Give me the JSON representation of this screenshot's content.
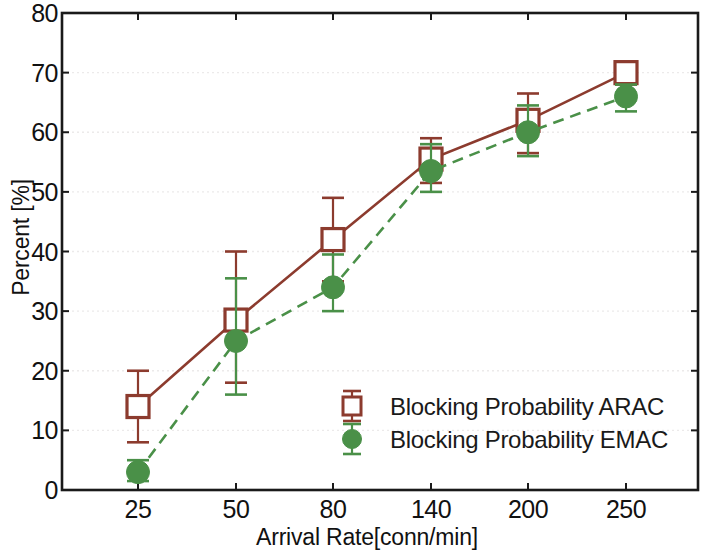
{
  "chart_data": {
    "type": "line",
    "title": "",
    "xlabel": "Arrival Rate[conn/min]",
    "ylabel": "Percent [%]",
    "categories": [
      "25",
      "50",
      "80",
      "140",
      "200",
      "250"
    ],
    "xticklabels": [
      "25",
      "50",
      "80",
      "140",
      "200",
      "250"
    ],
    "yticklabels": [
      "0",
      "10",
      "20",
      "30",
      "40",
      "50",
      "60",
      "70",
      "80"
    ],
    "yticks": [
      0,
      10,
      20,
      30,
      40,
      50,
      60,
      70,
      80
    ],
    "ylim": [
      0,
      80
    ],
    "grid": "dotted-horizontal",
    "legend_position": "lower-right-inside",
    "series": [
      {
        "name": "Blocking Probability ARAC",
        "color": "#8c3b2e",
        "marker": "open-square",
        "linestyle": "solid",
        "values": [
          14,
          28.5,
          42,
          55.5,
          62,
          70
        ],
        "err_low": [
          8,
          18,
          35,
          51.5,
          56.5,
          68
        ],
        "err_high": [
          20,
          40,
          49,
          59,
          66.5,
          71.5
        ]
      },
      {
        "name": "Blocking Probability EMAC",
        "color": "#4a9048",
        "marker": "filled-circle",
        "linestyle": "dashed",
        "values": [
          3,
          25,
          34,
          53.5,
          60,
          66
        ],
        "err_low": [
          1.5,
          16,
          30,
          50,
          56,
          63.5
        ],
        "err_high": [
          5,
          35.5,
          39.5,
          58,
          64.5,
          68
        ]
      }
    ]
  },
  "legend": {
    "entries": [
      {
        "label": "Blocking Probability ARAC",
        "color": "#8c3b2e",
        "marker": "open-square"
      },
      {
        "label": "Blocking Probability EMAC",
        "color": "#4a9048",
        "marker": "filled-circle"
      }
    ]
  },
  "colors": {
    "arac": "#8c3b2e",
    "emac": "#4a9048",
    "axis": "#1a1a1a",
    "grid": "#eceaea",
    "background": "#ffffff"
  }
}
